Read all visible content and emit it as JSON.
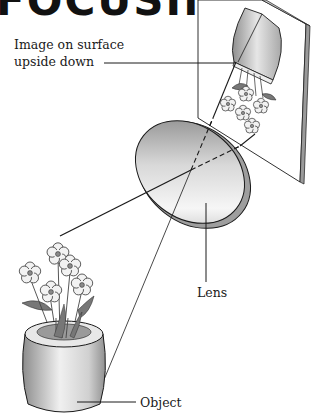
{
  "title": {
    "text": "FOCUSING",
    "note": "cropped at top edge; only bottoms of letters visible"
  },
  "labels": {
    "image_line1": "Image on surface",
    "image_line2": "upside down",
    "lens": "Lens",
    "object": "Object"
  },
  "colors": {
    "line": "#1a1a1a",
    "lens_light": "#f4f4f4",
    "lens_dark": "#8a8a8a",
    "pot_light": "#eeeeee",
    "pot_dark": "#9a9a9a",
    "petal": "#f2f2f2",
    "flower_center": "#8a8a8a",
    "leaf": "#777777"
  }
}
